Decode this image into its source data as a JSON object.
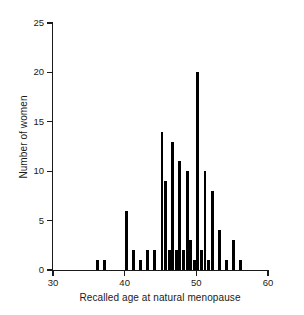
{
  "chart_data": {
    "type": "bar",
    "title": "",
    "xlabel": "Recalled age at natural menopause",
    "ylabel": "Number of women",
    "xlim": [
      30,
      60
    ],
    "ylim": [
      0,
      25
    ],
    "xticks": [
      30,
      40,
      50,
      60
    ],
    "yticks": [
      0,
      5,
      10,
      15,
      20,
      25
    ],
    "grid": false,
    "legend": null,
    "bin_width": 0.5,
    "bar_color": "#000000",
    "categories": [
      36.0,
      37.0,
      40.0,
      41.0,
      42.0,
      43.0,
      44.0,
      45.0,
      45.5,
      46.0,
      46.5,
      47.0,
      47.5,
      48.0,
      48.5,
      49.0,
      49.5,
      50.0,
      50.5,
      51.0,
      51.5,
      52.0,
      53.0,
      54.0,
      55.0,
      56.0
    ],
    "values": [
      1,
      1,
      6,
      2,
      1,
      2,
      2,
      14,
      9,
      2,
      13,
      2,
      11,
      2,
      10,
      3,
      1,
      20,
      2,
      10,
      1,
      8,
      4,
      1,
      3,
      1
    ],
    "bars": [
      {
        "x": 36.0,
        "count": 1
      },
      {
        "x": 37.0,
        "count": 1
      },
      {
        "x": 40.0,
        "count": 6
      },
      {
        "x": 41.0,
        "count": 2
      },
      {
        "x": 42.0,
        "count": 1
      },
      {
        "x": 43.0,
        "count": 2
      },
      {
        "x": 44.0,
        "count": 2
      },
      {
        "x": 45.0,
        "count": 14
      },
      {
        "x": 45.5,
        "count": 9
      },
      {
        "x": 46.0,
        "count": 2
      },
      {
        "x": 46.5,
        "count": 13
      },
      {
        "x": 47.0,
        "count": 2
      },
      {
        "x": 47.5,
        "count": 11
      },
      {
        "x": 48.0,
        "count": 2
      },
      {
        "x": 48.5,
        "count": 10
      },
      {
        "x": 49.0,
        "count": 3
      },
      {
        "x": 49.5,
        "count": 1
      },
      {
        "x": 50.0,
        "count": 20
      },
      {
        "x": 50.5,
        "count": 2
      },
      {
        "x": 51.0,
        "count": 10
      },
      {
        "x": 51.5,
        "count": 1
      },
      {
        "x": 52.0,
        "count": 8
      },
      {
        "x": 53.0,
        "count": 4
      },
      {
        "x": 54.0,
        "count": 1
      },
      {
        "x": 55.0,
        "count": 3
      },
      {
        "x": 56.0,
        "count": 1
      }
    ]
  }
}
